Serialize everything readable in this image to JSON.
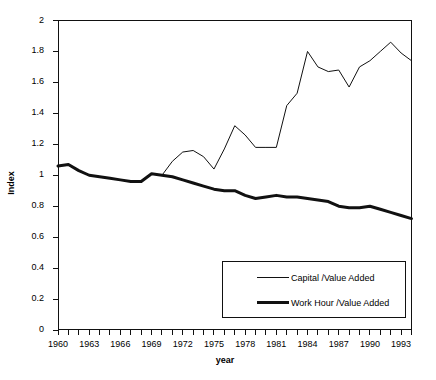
{
  "chart_data": {
    "type": "line",
    "title": "",
    "xlabel": "year",
    "ylabel": "Index",
    "xlim": [
      1960,
      1994
    ],
    "ylim": [
      0,
      2
    ],
    "grid": false,
    "legend_position": "inside-bottom-right",
    "ytick_labels": [
      "2",
      "1.8",
      "1.6",
      "1.4",
      "1.2",
      "1",
      "0.8",
      "0.6",
      "0.4",
      "0.2",
      "0"
    ],
    "ytick_values": [
      2,
      1.8,
      1.6,
      1.4,
      1.2,
      1,
      0.8,
      0.6,
      0.4,
      0.2,
      0
    ],
    "xtick_values": [
      1960,
      1961,
      1962,
      1963,
      1964,
      1965,
      1966,
      1967,
      1968,
      1969,
      1970,
      1971,
      1972,
      1973,
      1974,
      1975,
      1976,
      1977,
      1978,
      1979,
      1980,
      1981,
      1982,
      1983,
      1984,
      1985,
      1986,
      1987,
      1988,
      1989,
      1990,
      1991,
      1992,
      1993,
      1994
    ],
    "xtick_labels": [
      {
        "value": 1960,
        "label": "1960"
      },
      {
        "value": 1963,
        "label": "1963"
      },
      {
        "value": 1966,
        "label": "1966"
      },
      {
        "value": 1969,
        "label": "1969"
      },
      {
        "value": 1972,
        "label": "1972"
      },
      {
        "value": 1975,
        "label": "1975"
      },
      {
        "value": 1978,
        "label": "1978"
      },
      {
        "value": 1981,
        "label": "1981"
      },
      {
        "value": 1984,
        "label": "1984"
      },
      {
        "value": 1987,
        "label": "1987"
      },
      {
        "value": 1990,
        "label": "1990"
      },
      {
        "value": 1993,
        "label": "1993"
      }
    ],
    "x": [
      1960,
      1961,
      1962,
      1963,
      1964,
      1965,
      1966,
      1967,
      1968,
      1969,
      1970,
      1971,
      1972,
      1973,
      1974,
      1975,
      1976,
      1977,
      1978,
      1979,
      1980,
      1981,
      1982,
      1983,
      1984,
      1985,
      1986,
      1987,
      1988,
      1989,
      1990,
      1991,
      1992,
      1993,
      1994
    ],
    "series": [
      {
        "name": "Capital /Value Added",
        "style": "thin",
        "color": "#111111",
        "line_width": 1,
        "values": [
          1.06,
          1.07,
          1.03,
          1.0,
          0.99,
          0.98,
          0.97,
          0.96,
          0.96,
          1.01,
          1.0,
          1.09,
          1.15,
          1.16,
          1.12,
          1.04,
          1.17,
          1.32,
          1.26,
          1.18,
          1.18,
          1.18,
          1.45,
          1.53,
          1.8,
          1.7,
          1.67,
          1.68,
          1.57,
          1.7,
          1.74,
          1.8,
          1.86,
          1.79,
          1.74
        ]
      },
      {
        "name": "Work Hour /Value Added",
        "style": "thick",
        "color": "#111111",
        "line_width": 3,
        "values": [
          1.06,
          1.07,
          1.03,
          1.0,
          0.99,
          0.98,
          0.97,
          0.96,
          0.96,
          1.01,
          1.0,
          0.99,
          0.97,
          0.95,
          0.93,
          0.91,
          0.9,
          0.9,
          0.87,
          0.85,
          0.86,
          0.87,
          0.86,
          0.86,
          0.85,
          0.84,
          0.83,
          0.8,
          0.79,
          0.79,
          0.8,
          0.78,
          0.76,
          0.74,
          0.72
        ]
      }
    ]
  },
  "legend": {
    "entries": [
      {
        "label": "Capital /Value Added",
        "style": "thin"
      },
      {
        "label": "Work Hour /Value Added",
        "style": "thick"
      }
    ]
  }
}
